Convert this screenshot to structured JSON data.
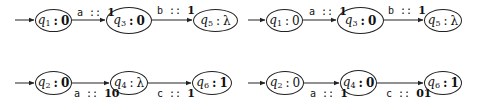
{
  "diagrams": [
    {
      "id": "top-left",
      "nodes": [
        {
          "name": "q",
          "sub": "1",
          "output": "0",
          "bold": true
        },
        {
          "name": "q",
          "sub": "3",
          "output": "0",
          "bold": true
        },
        {
          "name": "q",
          "sub": "5",
          "output": "λ",
          "bold": false
        }
      ],
      "edges": [
        {
          "symbol": "a",
          "sep": " :: ",
          "output": "1",
          "label_position": "above"
        },
        {
          "symbol": "b",
          "sep": " :: ",
          "output": "1",
          "label_position": "above"
        }
      ]
    },
    {
      "id": "top-right",
      "nodes": [
        {
          "name": "q",
          "sub": "1",
          "output": "0",
          "bold": false
        },
        {
          "name": "q",
          "sub": "3",
          "output": "0",
          "bold": true
        },
        {
          "name": "q",
          "sub": "5",
          "output": "λ",
          "bold": false
        }
      ],
      "edges": [
        {
          "symbol": "a",
          "sep": " :: ",
          "output": "1",
          "label_position": "above"
        },
        {
          "symbol": "b",
          "sep": " :: ",
          "output": "1",
          "label_position": "above"
        }
      ]
    },
    {
      "id": "bottom-left",
      "nodes": [
        {
          "name": "q",
          "sub": "2",
          "output": "0",
          "bold": true
        },
        {
          "name": "q",
          "sub": "4",
          "output": "λ",
          "bold": false
        },
        {
          "name": "q",
          "sub": "6",
          "output": "1",
          "bold": true
        }
      ],
      "edges": [
        {
          "symbol": "a",
          "sep": " :: ",
          "output": "10",
          "label_position": "below"
        },
        {
          "symbol": "c",
          "sep": " :: ",
          "output": "1",
          "label_position": "below"
        }
      ]
    },
    {
      "id": "bottom-right",
      "nodes": [
        {
          "name": "q",
          "sub": "2",
          "output": "0",
          "bold": false
        },
        {
          "name": "q",
          "sub": "4",
          "output": "0",
          "bold": true
        },
        {
          "name": "q",
          "sub": "6",
          "output": "1",
          "bold": true
        }
      ],
      "edges": [
        {
          "symbol": "a",
          "sep": " :: ",
          "output": "1",
          "label_position": "below"
        },
        {
          "symbol": "c",
          "sep": " :: ",
          "output": "01",
          "label_position": "below"
        }
      ]
    }
  ],
  "colors": {
    "stroke": "#222222",
    "background": "#ffffff",
    "text": "#111111"
  }
}
